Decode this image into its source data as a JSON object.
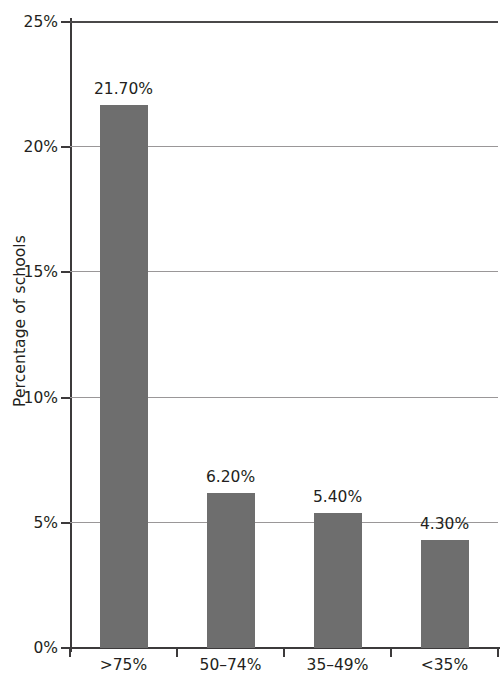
{
  "chart_data": {
    "type": "bar",
    "title": "",
    "xlabel": "",
    "ylabel": "Percentage of schools",
    "categories": [
      ">75%",
      "50–74%",
      "35–49%",
      "<35%"
    ],
    "values": [
      21.7,
      6.2,
      5.4,
      4.3
    ],
    "data_labels": [
      "21.70%",
      "6.20%",
      "5.40%",
      "4.30%"
    ],
    "ylim": [
      0,
      25
    ],
    "ytick_values": [
      0,
      5,
      10,
      15,
      20,
      25
    ],
    "ytick_labels": [
      "0%",
      "5%",
      "10%",
      "15%",
      "20%",
      "25%"
    ],
    "grid": true,
    "legend": false,
    "bar_color": "#6e6e6e",
    "axis_color": "#3c3a3b",
    "gridline_color": "#9a9798",
    "text_color": "#231f20"
  }
}
